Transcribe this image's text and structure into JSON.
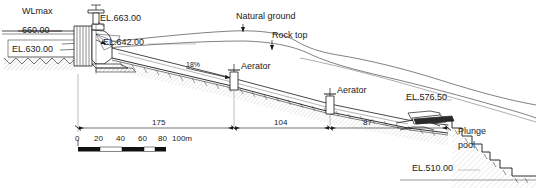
{
  "drawing": {
    "type": "dam-spillway-cross-section",
    "labels": {
      "wl_max_name": "WLmax",
      "wl_max_value": "660.00",
      "el_630": "EL.630.00",
      "el_663": "EL.663.00",
      "el_642": "EL.642.00",
      "el_576": "EL.576.50",
      "el_510": "EL.510.00",
      "natural_ground": "Natural ground",
      "rock_top": "Rock top",
      "aerator_upper": "Aerator",
      "aerator_lower": "Aerator",
      "plunge_pool_line1": "Plunge",
      "plunge_pool_line2": "pool",
      "slope": "18%"
    },
    "dimensions": [
      {
        "value": "175"
      },
      {
        "value": "104"
      },
      {
        "value": "87"
      }
    ],
    "scale_bar": {
      "ticks": [
        "0",
        "20",
        "40",
        "60",
        "80",
        "100m"
      ],
      "unit": "m"
    },
    "colors": {
      "line": "#1a1a1a",
      "thin": "#4a4a4a",
      "background": "#ffffff"
    }
  }
}
